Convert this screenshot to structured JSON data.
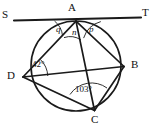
{
  "figure": {
    "stroke_color": "#1a1a1a",
    "background_color": "#ffffff"
  },
  "points": {
    "A": {
      "label": "A",
      "x": 76,
      "y": 22
    },
    "B": {
      "label": "B",
      "x": 124,
      "y": 66
    },
    "C": {
      "label": "C",
      "x": 94,
      "y": 110
    },
    "D": {
      "label": "D",
      "x": 23,
      "y": 77
    },
    "S": {
      "label": "S",
      "x": 8,
      "y": 17
    },
    "T": {
      "label": "T",
      "x": 143,
      "y": 15
    }
  },
  "labels": {
    "vertices": [
      {
        "name": "A",
        "text": "A",
        "left": 68,
        "top": 3
      },
      {
        "name": "B",
        "text": "B",
        "left": 132,
        "top": 60
      },
      {
        "name": "C",
        "text": "C",
        "left": 92,
        "top": 115
      },
      {
        "name": "D",
        "text": "D",
        "left": 8,
        "top": 71
      },
      {
        "name": "S",
        "text": "S",
        "left": 2,
        "top": 10
      },
      {
        "name": "T",
        "text": "T",
        "left": 143,
        "top": 9
      }
    ],
    "angles": [
      {
        "name": "angle-q",
        "text": "q",
        "left": 56,
        "top": 27,
        "kind": "variable"
      },
      {
        "name": "angle-n",
        "text": "n",
        "left": 72,
        "top": 29,
        "kind": "variable"
      },
      {
        "name": "angle-p",
        "text": "p",
        "left": 90,
        "top": 26,
        "kind": "variable"
      },
      {
        "name": "angle-d",
        "text": "42°",
        "left": 33,
        "top": 61,
        "kind": "value"
      },
      {
        "name": "angle-c",
        "text": "103°",
        "left": 76,
        "top": 86,
        "kind": "value"
      }
    ]
  },
  "geometry": {
    "circle": {
      "cx": 76,
      "cy": 66,
      "r": 45
    },
    "tangent_line": {
      "x1": 14,
      "y1": 20,
      "x2": 140,
      "y2": 17
    },
    "chords": [
      {
        "name": "chord-AB",
        "from": "A",
        "to": "B"
      },
      {
        "name": "chord-AC",
        "from": "A",
        "to": "C"
      },
      {
        "name": "chord-AD",
        "from": "A",
        "to": "D"
      },
      {
        "name": "chord-DB",
        "from": "D",
        "to": "B"
      },
      {
        "name": "chord-DC",
        "from": "D",
        "to": "C"
      },
      {
        "name": "chord-CB",
        "from": "C",
        "to": "B"
      }
    ],
    "angle_arcs": [
      {
        "name": "arc-q",
        "vertex": "A"
      },
      {
        "name": "arc-n",
        "vertex": "A"
      },
      {
        "name": "arc-p",
        "vertex": "A"
      },
      {
        "name": "arc-42",
        "vertex": "D"
      },
      {
        "name": "arc-103",
        "vertex": "C"
      }
    ]
  }
}
